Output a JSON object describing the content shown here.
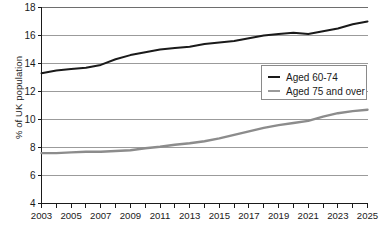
{
  "chart_data": {
    "type": "line",
    "title": "",
    "xlabel": "",
    "ylabel": "% of UK population",
    "xlim": [
      2003,
      2025
    ],
    "ylim": [
      4,
      18
    ],
    "yticks": [
      4,
      6,
      8,
      10,
      12,
      14,
      16,
      18
    ],
    "xticks": [
      2003,
      2004,
      2005,
      2006,
      2007,
      2008,
      2009,
      2010,
      2011,
      2012,
      2013,
      2014,
      2015,
      2016,
      2017,
      2018,
      2019,
      2020,
      2021,
      2022,
      2023,
      2024,
      2025
    ],
    "xtick_labels": [
      "2003",
      "2005",
      "2007",
      "2009",
      "2011",
      "2013",
      "2015",
      "2017",
      "2019",
      "2021",
      "2023",
      "2025"
    ],
    "xtick_labels_years": [
      2003,
      2005,
      2007,
      2009,
      2011,
      2013,
      2015,
      2017,
      2019,
      2021,
      2023,
      2025
    ],
    "grid": "horizontal",
    "legend_position": "center-right",
    "x": [
      2003,
      2004,
      2005,
      2006,
      2007,
      2008,
      2009,
      2010,
      2011,
      2012,
      2013,
      2014,
      2015,
      2016,
      2017,
      2018,
      2019,
      2020,
      2021,
      2022,
      2023,
      2024,
      2025
    ],
    "series": [
      {
        "name": "Aged 60-74",
        "color": "#1a1a1a",
        "width": 2.0,
        "values": [
          13.3,
          13.5,
          13.6,
          13.7,
          13.9,
          14.3,
          14.6,
          14.8,
          15.0,
          15.1,
          15.2,
          15.4,
          15.5,
          15.6,
          15.8,
          16.0,
          16.1,
          16.2,
          16.1,
          16.3,
          16.5,
          16.8,
          17.0
        ]
      },
      {
        "name": "Aged 75 and over",
        "color": "#8c8c8c",
        "width": 2.4,
        "values": [
          7.6,
          7.6,
          7.65,
          7.7,
          7.7,
          7.75,
          7.8,
          7.95,
          8.05,
          8.2,
          8.3,
          8.45,
          8.65,
          8.9,
          9.15,
          9.4,
          9.6,
          9.75,
          9.9,
          10.2,
          10.45,
          10.6,
          10.7
        ]
      }
    ]
  },
  "legend": {
    "items": [
      {
        "label": "Aged 60-74",
        "color": "#1a1a1a"
      },
      {
        "label": "Aged 75 and over",
        "color": "#8c8c8c"
      }
    ]
  },
  "axes": {
    "y_axis_title": "% of UK population"
  }
}
